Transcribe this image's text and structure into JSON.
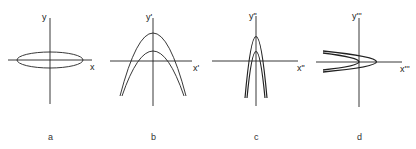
{
  "figure": {
    "panels": [
      {
        "id": "a",
        "caption": "a",
        "x_label": "x",
        "y_label": "y",
        "curve": "ellipse"
      },
      {
        "id": "b",
        "caption": "b",
        "x_label": "x'",
        "y_label": "y'",
        "curve": "two-downward-parabolas-wide"
      },
      {
        "id": "c",
        "caption": "c",
        "x_label": "x\"",
        "y_label": "y\"",
        "curve": "two-downward-parabolas-narrow"
      },
      {
        "id": "d",
        "caption": "d",
        "x_label": "x'''",
        "y_label": "y'''",
        "curve": "two-rightward-parabolas"
      }
    ],
    "stroke_color": "#222222"
  }
}
